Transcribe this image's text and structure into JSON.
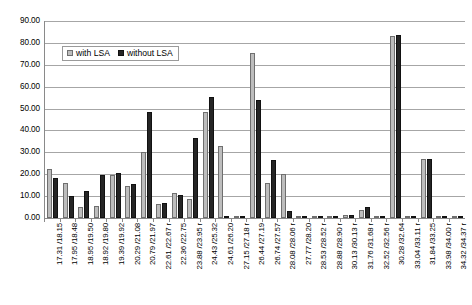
{
  "chart_data": {
    "type": "bar",
    "title": "",
    "xlabel": "",
    "ylabel": "",
    "ylim": [
      0,
      90
    ],
    "ytick_step": 10,
    "grid": true,
    "legend_position": "top-left-inside",
    "ytick_labels": [
      "90.00",
      "80.00",
      "70.00",
      "60.00",
      "50.00",
      "40.00",
      "30.00",
      "20.00",
      "10.00",
      "0.00"
    ],
    "ytick_values": [
      90,
      80,
      70,
      60,
      50,
      40,
      30,
      20,
      10,
      0
    ],
    "categories": [
      "17.31 /18.15",
      "17.95 /18.48",
      "18.95 /19.50",
      "18.92 /19.80",
      "19.39 /19.92",
      "20.29 /21.08",
      "20.79 /21.97",
      "22.61 /22.67 r",
      "22.36 /22.75",
      "23.88 /23.95 r",
      "24.43 /25.32",
      "24.61 /26.20",
      "27.15 /27.18 r",
      "26.44 /27.19",
      "26.74 /27.57",
      "28.08 /28.06 r",
      "27.77 /28.20",
      "28.53 /28.52 r",
      "28.88 /28.90 r",
      "30.13 /30.13 r",
      "31.76 /31.68 r",
      "32.52 /32.56 r",
      "30.28 /32.64",
      "33.04 /33.11 r",
      "31.84 /33.25",
      "33.98 /34.00 r",
      "34.32 /34.37 r"
    ],
    "series": [
      {
        "name": "with LSA",
        "color": "#bdbdbd",
        "values": [
          22.5,
          16.0,
          5.0,
          5.5,
          19.5,
          14.5,
          30.0,
          6.5,
          11.5,
          8.5,
          48.5,
          33.0,
          1.0,
          75.5,
          16.0,
          20.0,
          1.0,
          1.0,
          1.0,
          1.5,
          3.5,
          0.5,
          83.0,
          1.0,
          27.0,
          0.5,
          0.5
        ]
      },
      {
        "name": "without LSA",
        "color": "#252525",
        "values": [
          18.5,
          10.0,
          12.5,
          19.5,
          20.5,
          15.5,
          48.5,
          7.0,
          10.5,
          36.5,
          55.5,
          1.0,
          1.0,
          54.0,
          26.5,
          3.0,
          0.5,
          1.0,
          1.0,
          1.5,
          5.0,
          0.5,
          83.5,
          1.0,
          27.0,
          0.5,
          0.5
        ]
      }
    ]
  },
  "legend": {
    "items": [
      {
        "label": "with LSA"
      },
      {
        "label": "without LSA"
      }
    ]
  }
}
